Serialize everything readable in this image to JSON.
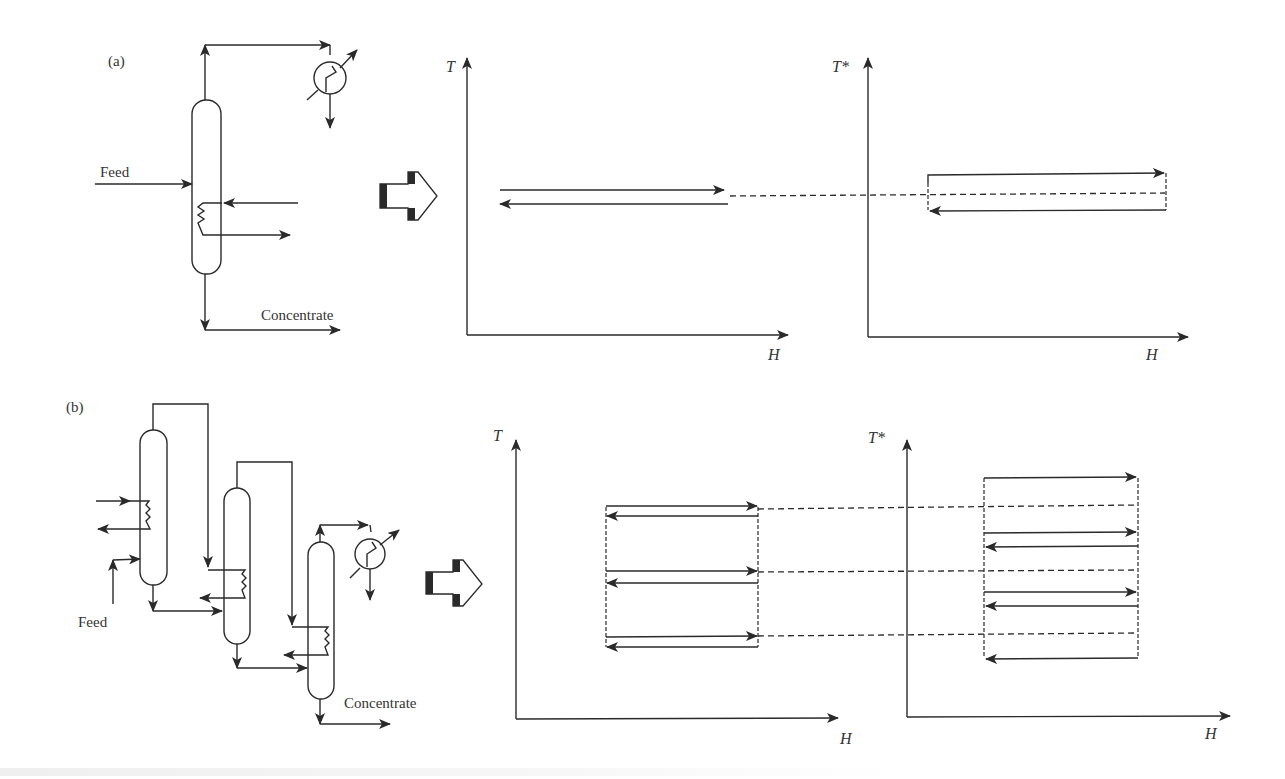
{
  "figure": {
    "panel_a": {
      "label": "(a)",
      "feed_label": "Feed",
      "concentrate_label": "Concentrate",
      "plot_left": {
        "y_axis": "T",
        "x_axis": "H"
      },
      "plot_right": {
        "y_axis": "T*",
        "x_axis": "H"
      }
    },
    "panel_b": {
      "label": "(b)",
      "feed_label": "Feed",
      "concentrate_label": "Concentrate",
      "plot_left": {
        "y_axis": "T",
        "x_axis": "H"
      },
      "plot_right": {
        "y_axis": "T*",
        "x_axis": "H"
      }
    }
  },
  "colors": {
    "line": "#2a2a2a",
    "text": "#333333",
    "background": "#ffffff"
  }
}
